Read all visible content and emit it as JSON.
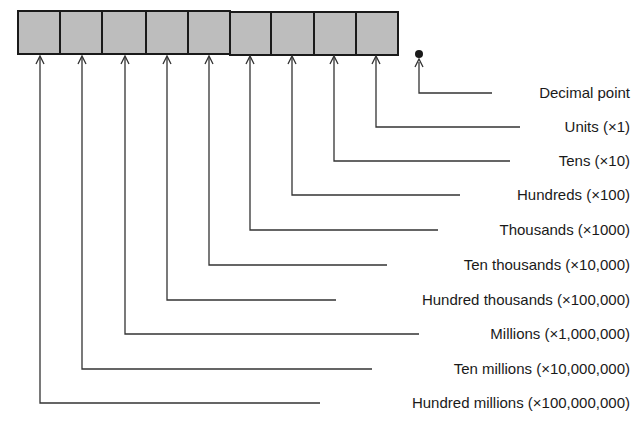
{
  "diagram": {
    "register": {
      "cell_count": 9,
      "fill_color": "#bdbdbd",
      "border_color": "#1a1a1a"
    },
    "decimal_point_label": "Decimal point",
    "places": [
      {
        "name": "Units",
        "multiplier": "×1",
        "label": "Units (×1)"
      },
      {
        "name": "Tens",
        "multiplier": "×10",
        "label": "Tens (×10)"
      },
      {
        "name": "Hundreds",
        "multiplier": "×100",
        "label": "Hundreds (×100)"
      },
      {
        "name": "Thousands",
        "multiplier": "×1000",
        "label": "Thousands (×1000)"
      },
      {
        "name": "Ten thousands",
        "multiplier": "×10,000",
        "label": "Ten thousands (×10,000)"
      },
      {
        "name": "Hundred thousands",
        "multiplier": "×100,000",
        "label": "Hundred thousands (×100,000)"
      },
      {
        "name": "Millions",
        "multiplier": "×1,000,000",
        "label": "Millions (×1,000,000)"
      },
      {
        "name": "Ten millions",
        "multiplier": "×10,000,000",
        "label": "Ten millions (×10,000,000)"
      },
      {
        "name": "Hundred millions",
        "multiplier": "×100,000,000",
        "label": "Hundred millions (×100,000,000)"
      }
    ]
  }
}
